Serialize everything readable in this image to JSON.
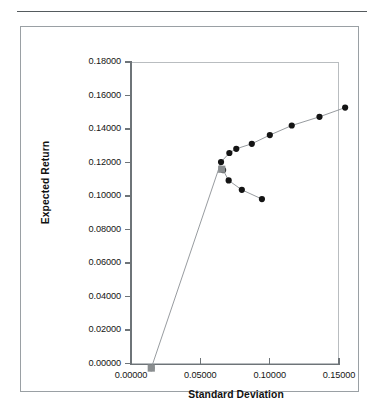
{
  "chart_data": {
    "type": "line",
    "title": "",
    "xlabel": "Standard Deviation",
    "ylabel": "Expected Return",
    "xlim": [
      0.0,
      0.15
    ],
    "ylim": [
      0.0,
      0.18
    ],
    "xticks": [
      "0.00000",
      "0.05000",
      "0.10000",
      "0.15000"
    ],
    "xtick_values": [
      0.0,
      0.05,
      0.1,
      0.15
    ],
    "yticks": [
      "0.00000",
      "0.02000",
      "0.04000",
      "0.06000",
      "0.08000",
      "0.10000",
      "0.12000",
      "0.14000",
      "0.16000",
      "0.18000"
    ],
    "ytick_values": [
      0.0,
      0.02,
      0.04,
      0.06,
      0.08,
      0.1,
      0.12,
      0.14,
      0.16,
      0.18
    ],
    "grid": false,
    "legend": "none",
    "marker_color": "#141414",
    "line_color": "#8b9094",
    "special_marker_color": "#8a8e90",
    "series": [
      {
        "name": "Efficient frontier (upper branch)",
        "marker": "circle",
        "x": [
          0.0002,
          0.0505,
          0.0565,
          0.0615,
          0.0727,
          0.0857,
          0.1015,
          0.1215,
          0.14
        ],
        "y": [
          0.0128,
          0.1358,
          0.1412,
          0.1437,
          0.1467,
          0.1519,
          0.1576,
          0.1628,
          0.1683
        ]
      },
      {
        "name": "Inefficient frontier (lower branch)",
        "marker": "circle",
        "x": [
          0.052,
          0.056,
          0.0655,
          0.08
        ],
        "y": [
          0.131,
          0.1248,
          0.1192,
          0.1137
        ]
      },
      {
        "name": "Minimum variance / risk-free markers",
        "marker": "square",
        "x": [
          0.0002,
          0.051
        ],
        "y": [
          0.0128,
          0.1315
        ]
      }
    ]
  },
  "axes": {
    "x_title": "Standard Deviation",
    "y_title": "Expected Return"
  }
}
